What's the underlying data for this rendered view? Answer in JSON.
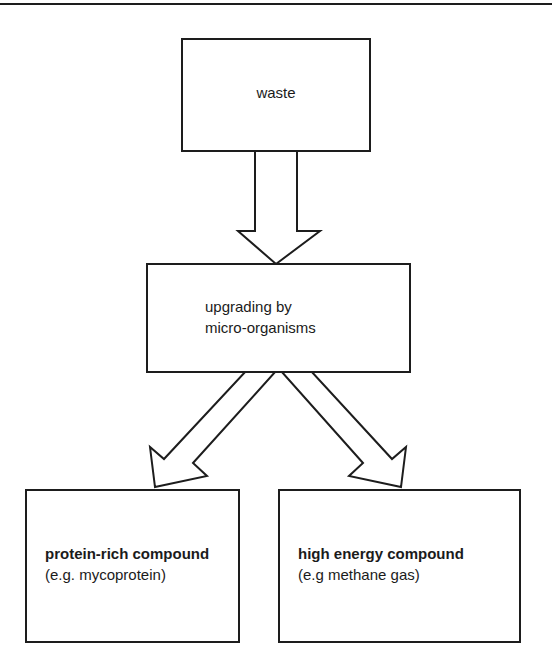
{
  "diagram": {
    "stroke_color": "#1d1d1d",
    "text_color": "#1b1b1b",
    "background_color": "#ffffff",
    "top_rule": {
      "name": "top-horizontal-rule"
    },
    "nodes": {
      "waste": {
        "label": "waste"
      },
      "upgrading": {
        "line1": "upgrading by",
        "line2": "micro-organisms"
      },
      "protein": {
        "line1": "protein-rich compound",
        "line2": "(e.g. mycoprotein)"
      },
      "energy": {
        "line1": "high energy compound",
        "line2": "(e.g methane gas)"
      }
    },
    "arrows": {
      "waste_to_upgrading": {
        "name": "down-arrow",
        "direction": "down",
        "from": "waste",
        "to": "upgrading"
      },
      "upgrading_to_protein": {
        "name": "down-left-arrow",
        "direction": "down-left",
        "from": "upgrading",
        "to": "protein"
      },
      "upgrading_to_energy": {
        "name": "down-right-arrow",
        "direction": "down-right",
        "from": "upgrading",
        "to": "energy"
      }
    }
  }
}
